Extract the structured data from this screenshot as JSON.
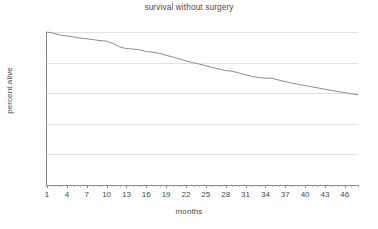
{
  "chart_data": {
    "type": "line",
    "title": "survival without surgery",
    "xlabel": "months",
    "ylabel": "percent alive",
    "xlim": [
      1,
      48
    ],
    "ylim": [
      50,
      100
    ],
    "grid": true,
    "legend": null,
    "y_ticks": [
      50,
      60,
      70,
      80,
      90,
      100
    ],
    "x_ticks": [
      1,
      4,
      7,
      10,
      13,
      16,
      19,
      22,
      25,
      28,
      31,
      34,
      37,
      40,
      43,
      46
    ],
    "line_color": "#8c8c8c",
    "grid_color": "#e2e2e2",
    "axis_color": "#8a8a8a",
    "series": [
      {
        "name": "survival without surgery",
        "x": [
          1,
          2,
          3,
          4,
          5,
          6,
          7,
          8,
          9,
          10,
          11,
          12,
          13,
          14,
          15,
          16,
          17,
          18,
          19,
          20,
          21,
          22,
          23,
          24,
          25,
          26,
          27,
          28,
          29,
          30,
          31,
          32,
          33,
          34,
          35,
          36,
          37,
          38,
          39,
          40,
          41,
          42,
          43,
          44,
          45,
          46,
          47,
          48
        ],
        "values": [
          100.0,
          99.6,
          99.0,
          98.7,
          98.4,
          98.0,
          97.8,
          97.5,
          97.2,
          97.0,
          96.2,
          95.1,
          94.6,
          94.4,
          94.2,
          93.6,
          93.4,
          93.0,
          92.4,
          91.8,
          91.2,
          90.6,
          90.0,
          89.5,
          89.0,
          88.4,
          87.9,
          87.4,
          87.2,
          86.6,
          86.0,
          85.5,
          85.1,
          84.9,
          84.9,
          84.3,
          83.8,
          83.3,
          82.9,
          82.5,
          82.1,
          81.7,
          81.3,
          80.9,
          80.5,
          80.2,
          79.8,
          79.5
        ]
      }
    ]
  }
}
